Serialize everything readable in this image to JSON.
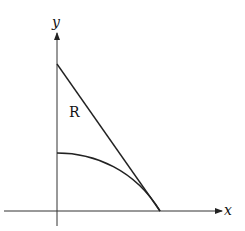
{
  "diagram": {
    "axes": {
      "x_label": "x",
      "y_label": "y"
    },
    "region_label": "R",
    "elements": [
      {
        "type": "line",
        "description": "straight line from y-axis intercept down to x-axis intercept"
      },
      {
        "type": "curve",
        "description": "concave-down curve from lower y-axis intercept to same x-axis intercept"
      }
    ]
  }
}
